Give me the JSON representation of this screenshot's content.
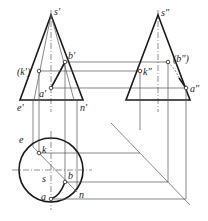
{
  "diagram": {
    "title": "",
    "type": "cone three-view projection (front, side, top)",
    "colors": {
      "line": "#1a1a1a",
      "construction": "#555555",
      "background": "#ffffff"
    },
    "front_view": {
      "labels": {
        "apex": "s'",
        "b": "b'",
        "k": "(k')",
        "a": "a'",
        "e": "e'",
        "n": "n'"
      }
    },
    "side_view": {
      "labels": {
        "apex": "s\"",
        "b": "(b\")",
        "k": "k\"",
        "a": "a\""
      }
    },
    "top_view": {
      "labels": {
        "center": "s",
        "e": "e",
        "k": "k",
        "b": "b",
        "a": "a",
        "n": "n"
      }
    }
  }
}
